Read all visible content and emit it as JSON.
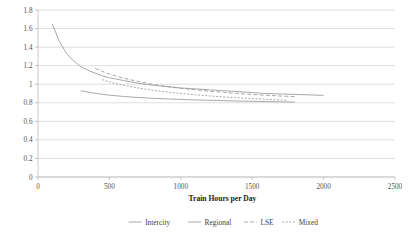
{
  "chart_data": {
    "type": "line",
    "title": "",
    "xlabel": "Train Hours per Day",
    "ylabel": "",
    "xlim": [
      0,
      2500
    ],
    "ylim": [
      0,
      1.8
    ],
    "xticks": [
      0,
      500,
      1000,
      1500,
      2000,
      2500
    ],
    "yticks": [
      0,
      0.2,
      0.4,
      0.6,
      0.8,
      1,
      1.2,
      1.4,
      1.6,
      1.8
    ],
    "xtick_labels": [
      "0",
      "500",
      "1000",
      "1500",
      "2000",
      "2500"
    ],
    "ytick_labels": [
      "0",
      "0.2",
      "0.4",
      "0.6",
      "0.8",
      "1",
      "1.2",
      "1.4",
      "1.6",
      "1.8"
    ],
    "grid": "horizontal",
    "legend_position": "bottom",
    "line_color": "#9a9a9a",
    "series": [
      {
        "name": "Intercity",
        "style": "solid",
        "x": [
          100,
          150,
          200,
          250,
          300,
          350,
          400,
          450,
          500,
          600,
          700,
          800,
          900,
          1000,
          1100,
          1200,
          1300,
          1400,
          1500,
          1600,
          1700,
          1800,
          1900,
          2000
        ],
        "values": [
          1.65,
          1.46,
          1.33,
          1.25,
          1.19,
          1.15,
          1.12,
          1.09,
          1.07,
          1.04,
          1.01,
          0.99,
          0.975,
          0.96,
          0.95,
          0.94,
          0.93,
          0.92,
          0.91,
          0.9,
          0.895,
          0.89,
          0.885,
          0.88
        ]
      },
      {
        "name": "Regional",
        "style": "solid",
        "x": [
          300,
          350,
          400,
          450,
          500,
          600,
          700,
          800,
          900,
          1000,
          1100,
          1200,
          1300,
          1400,
          1500,
          1600,
          1700,
          1800
        ],
        "values": [
          0.93,
          0.915,
          0.902,
          0.891,
          0.882,
          0.868,
          0.857,
          0.849,
          0.842,
          0.836,
          0.831,
          0.827,
          0.823,
          0.819,
          0.816,
          0.813,
          0.81,
          0.807
        ]
      },
      {
        "name": "LSE",
        "style": "dashed",
        "x": [
          400,
          450,
          500,
          600,
          700,
          800,
          900,
          1000,
          1100,
          1200,
          1300,
          1400,
          1500,
          1600,
          1700,
          1800
        ],
        "values": [
          1.17,
          1.14,
          1.11,
          1.065,
          1.03,
          1.0,
          0.975,
          0.955,
          0.94,
          0.925,
          0.912,
          0.9,
          0.89,
          0.881,
          0.873,
          0.866
        ]
      },
      {
        "name": "Mixed",
        "style": "dotted",
        "x": [
          450,
          500,
          550,
          600,
          700,
          800,
          900,
          1000,
          1100,
          1200,
          1300,
          1400,
          1500,
          1600,
          1700,
          1750
        ],
        "values": [
          1.05,
          1.025,
          1.005,
          0.988,
          0.96,
          0.936,
          0.917,
          0.9,
          0.886,
          0.874,
          0.863,
          0.853,
          0.845,
          0.837,
          0.83,
          0.827
        ]
      }
    ],
    "legend": [
      {
        "label": "Intercity",
        "style": "solid"
      },
      {
        "label": "Regional",
        "style": "solid"
      },
      {
        "label": "LSE",
        "style": "dashed"
      },
      {
        "label": "Mixed",
        "style": "dotted"
      }
    ]
  }
}
